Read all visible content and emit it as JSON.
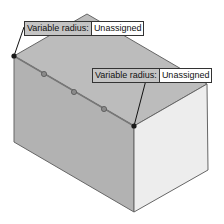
{
  "callouts": [
    {
      "label": "Variable radius:",
      "value": "Unassigned"
    },
    {
      "label": "Variable radius:",
      "value": "Unassigned"
    }
  ],
  "colors": {
    "top_face": "#b9b9b9",
    "front_face": "#b3b3b3",
    "right_face": "#ececec",
    "edge": "#555555",
    "vertex": "#1a1a1a",
    "control_point": "#888888"
  }
}
